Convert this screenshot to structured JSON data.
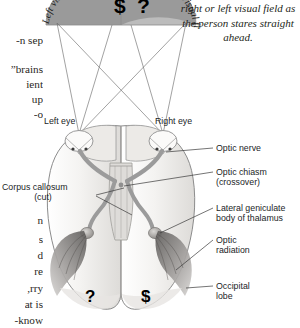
{
  "figure": {
    "caption_italic": "right or left visual field as the person stares straight ahead."
  },
  "body_text_column": {
    "lines": [
      "n sep-",
      "",
      "brains”",
      "ient",
      "up",
      "o-",
      "",
      "",
      "",
      "",
      "",
      "n",
      "s",
      "d",
      "re",
      "rry,",
      "at is",
      "know-"
    ]
  },
  "visual_field": {
    "left_label": "Left visual field",
    "right_label": "Right visual field",
    "left_symbol": "$",
    "right_symbol": "?",
    "left_fill": "#9a9a9a",
    "right_fill": "#b9b9b9"
  },
  "eyes": {
    "left_label": "Left eye",
    "right_label": "Right eye"
  },
  "brain_symbols": {
    "left_hemisphere": "?",
    "right_hemisphere": "$"
  },
  "labels": {
    "corpus_callosum": "Corpus callosum",
    "corpus_callosum_sub": "(cut)",
    "optic_nerve": "Optic nerve",
    "optic_chiasm": "Optic chiasm",
    "optic_chiasm_sub": "(crossover)",
    "lateral_geniculate": "Lateral geniculate",
    "lateral_geniculate_sub": "body of thalamus",
    "optic_radiation": "Optic",
    "optic_radiation_sub": "radiation",
    "occipital_lobe": "Occipital",
    "occipital_lobe_sub": "lobe"
  },
  "colors": {
    "ink": "#231f20",
    "leader": "#3a3a3a",
    "brain_outline": "#8c8c8c",
    "brain_fill": "#f2f1ef",
    "tract": "#9b9b9b",
    "radiation": "#6e6e6e"
  }
}
